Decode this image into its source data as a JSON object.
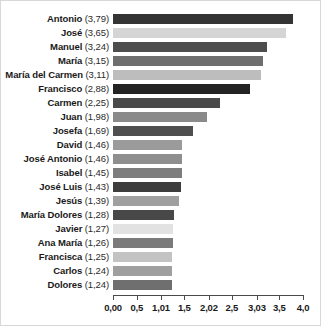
{
  "chart_data": {
    "type": "bar",
    "orientation": "horizontal",
    "title": "",
    "subtitle": "",
    "xlabel": "",
    "ylabel": "",
    "xlim": [
      0,
      4.0
    ],
    "grid": false,
    "legend": null,
    "decimal_separator": ",",
    "xtick_labels": [
      "0,00",
      "0,5",
      "1,01",
      "1,5",
      "2,02",
      "2,5",
      "3,03",
      "3,5",
      "4,0"
    ],
    "xtick_values": [
      0.0,
      0.5,
      1.01,
      1.5,
      2.02,
      2.5,
      3.03,
      3.5,
      4.0
    ],
    "categories": [
      "Antonio",
      "José",
      "Manuel",
      "María",
      "María del Carmen",
      "Francisco",
      "Carmen",
      "Juan",
      "Josefa",
      "David",
      "José Antonio",
      "Isabel",
      "José Luis",
      "Jesús",
      "María Dolores",
      "Javier",
      "Ana María",
      "Francisca",
      "Carlos",
      "Dolores"
    ],
    "values": [
      3.79,
      3.65,
      3.24,
      3.15,
      3.11,
      2.88,
      2.25,
      1.98,
      1.69,
      1.46,
      1.46,
      1.45,
      1.43,
      1.39,
      1.28,
      1.27,
      1.26,
      1.25,
      1.24,
      1.24
    ],
    "value_labels": [
      "3,79",
      "3,65",
      "3,24",
      "3,15",
      "3,11",
      "2,88",
      "2,25",
      "1,98",
      "1,69",
      "1,46",
      "1,46",
      "1,45",
      "1,43",
      "1,39",
      "1,28",
      "1,27",
      "1,26",
      "1,25",
      "1,24",
      "1,24"
    ],
    "bar_colors": [
      "#343434",
      "#d5d5d5",
      "#4d4d4d",
      "#6e6e6e",
      "#bdbdbd",
      "#232323",
      "#4a4a4a",
      "#8a8a8a",
      "#4f4f4f",
      "#9b9b9b",
      "#8e8e8e",
      "#7d7d7d",
      "#3d3d3d",
      "#a0a0a0",
      "#484848",
      "#e2e2e2",
      "#7b7b7b",
      "#c3c3c3",
      "#9f9f9f",
      "#6f6f6f"
    ]
  },
  "rows": [
    {
      "name": "Antonio",
      "value_text": "(3,79)"
    },
    {
      "name": "José",
      "value_text": "(3,65)"
    },
    {
      "name": "Manuel",
      "value_text": "(3,24)"
    },
    {
      "name": "María",
      "value_text": "(3,15)"
    },
    {
      "name": "María del Carmen",
      "value_text": "(3,11)"
    },
    {
      "name": "Francisco",
      "value_text": "(2,88)"
    },
    {
      "name": "Carmen",
      "value_text": "(2,25)"
    },
    {
      "name": "Juan",
      "value_text": "(1,98)"
    },
    {
      "name": "Josefa",
      "value_text": "(1,69)"
    },
    {
      "name": "David",
      "value_text": "(1,46)"
    },
    {
      "name": "José Antonio",
      "value_text": "(1,46)"
    },
    {
      "name": "Isabel",
      "value_text": "(1,45)"
    },
    {
      "name": "José Luis",
      "value_text": "(1,43)"
    },
    {
      "name": "Jesús",
      "value_text": "(1,39)"
    },
    {
      "name": "María Dolores",
      "value_text": "(1,28)"
    },
    {
      "name": "Javier",
      "value_text": "(1,27)"
    },
    {
      "name": "Ana María",
      "value_text": "(1,26)"
    },
    {
      "name": "Francisca",
      "value_text": "(1,25)"
    },
    {
      "name": "Carlos",
      "value_text": "(1,24)"
    },
    {
      "name": "Dolores",
      "value_text": "(1,24)"
    }
  ],
  "colors": {
    "frame_border": "#d8d8d8",
    "background": "#ffffff",
    "axis": "#4a4a4a",
    "text": "#1a1a1a"
  }
}
